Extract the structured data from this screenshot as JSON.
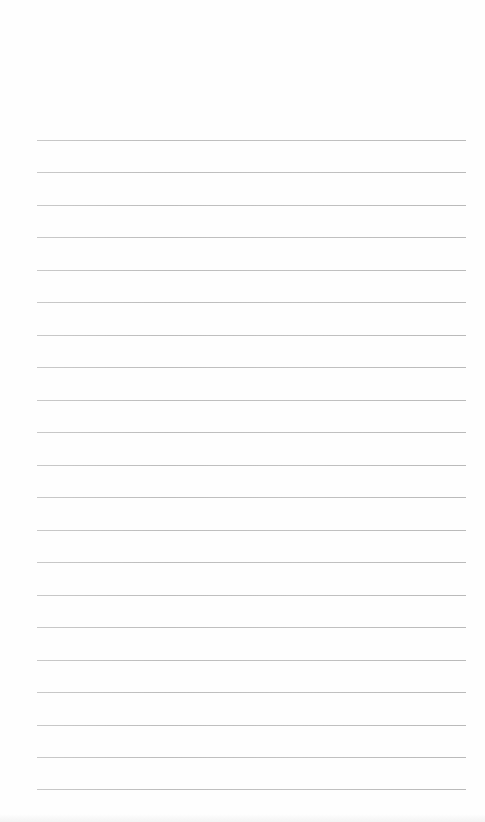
{
  "page": {
    "type": "lined-notepaper",
    "background_color": "#fefefe",
    "rule_color": "#bfbfbf",
    "rule_count": 21,
    "rule_left": 37,
    "rule_right": 466,
    "first_rule_top": 140,
    "rule_spacing": 32.45,
    "rules": [
      140,
      172,
      205,
      237,
      270,
      302,
      335,
      367,
      400,
      432,
      465,
      497,
      530,
      562,
      595,
      627,
      660,
      692,
      725,
      757,
      789
    ]
  }
}
